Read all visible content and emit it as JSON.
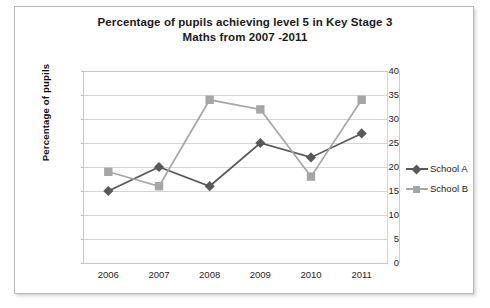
{
  "chart_data": {
    "type": "line",
    "title": "Percentage of pupils achieving level 5 in Key Stage 3 Maths from 2007 -2011",
    "title_line1": "Percentage of pupils achieving level 5 in Key Stage 3",
    "title_line2": "Maths from 2007 -2011",
    "xlabel": "",
    "ylabel": "Percentage of pupils",
    "categories": [
      "2006",
      "2007",
      "2008",
      "2009",
      "2010",
      "2011"
    ],
    "series": [
      {
        "name": "School A",
        "values": [
          15,
          20,
          16,
          25,
          22,
          27
        ],
        "color": "#595959",
        "marker": "diamond"
      },
      {
        "name": "School B",
        "values": [
          19,
          16,
          34,
          32,
          18,
          34
        ],
        "color": "#a6a6a6",
        "marker": "square"
      }
    ],
    "ylim": [
      0,
      40
    ],
    "ytick_labels": [
      "40",
      "35",
      "30",
      "25",
      "20",
      "15",
      "10",
      "5",
      "0"
    ],
    "ytick_values": [
      40,
      35,
      30,
      25,
      20,
      15,
      10,
      5,
      0
    ],
    "ystep": 5,
    "grid": true,
    "legend_position": "right",
    "legend_entries": [
      "School A",
      "School B"
    ]
  },
  "colors": {
    "frame_border": "#b9b9b9",
    "gridline": "#d4d4d4",
    "axis": "#c8c8c8",
    "text": "#1a1a1a",
    "school_a": "#595959",
    "school_b": "#a6a6a6"
  }
}
